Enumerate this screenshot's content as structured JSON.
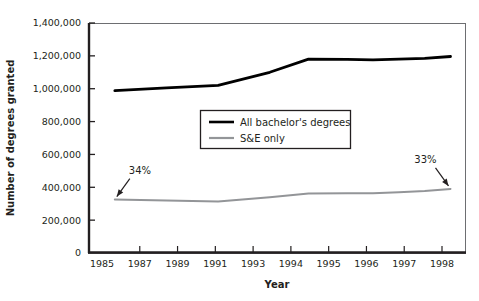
{
  "chart_data": {
    "type": "line",
    "title": "",
    "xlabel": "Year",
    "ylabel": "Number of degrees granted",
    "grid": false,
    "legend_position": "center",
    "ylim": [
      0,
      1400000
    ],
    "ytick_labels": [
      "1,400,000",
      "1,200,000",
      "1,000,000",
      "800,000",
      "600,000",
      "400,000",
      "200,000",
      "0"
    ],
    "ytick_values": [
      1400000,
      1200000,
      1000000,
      800000,
      600000,
      400000,
      200000,
      0
    ],
    "xtick_labels": [
      "1985",
      "1987",
      "1989",
      "1991",
      "1993",
      "1994",
      "1995",
      "1996",
      "1997",
      "1998"
    ],
    "x": [
      1986,
      1988,
      1990,
      1992,
      1993.5,
      1995,
      1996,
      1997,
      1998,
      1999
    ],
    "series": [
      {
        "name": "All bachelor's degrees",
        "color": "#000000",
        "values": [
          988000,
          1005000,
          1020000,
          1100000,
          1180000,
          1178000,
          1176000,
          1180000,
          1185000,
          1196000
        ]
      },
      {
        "name": "S&E only",
        "color": "#939598",
        "values": [
          325000,
          320000,
          314000,
          340000,
          362000,
          363000,
          364000,
          370000,
          378000,
          390000
        ]
      }
    ],
    "annotations": [
      {
        "text": "34%",
        "series": "S&E only",
        "at_x": 1986,
        "at_y": 325000
      },
      {
        "text": "33%",
        "series": "S&E only",
        "at_x": 1999,
        "at_y": 390000
      }
    ]
  },
  "legend": {
    "entries": [
      {
        "label": "All bachelor's degrees",
        "color": "#000000"
      },
      {
        "label": "S&E only",
        "color": "#939598"
      }
    ]
  },
  "axes": {
    "x_title": "Year",
    "y_title": "Number of degrees granted"
  }
}
